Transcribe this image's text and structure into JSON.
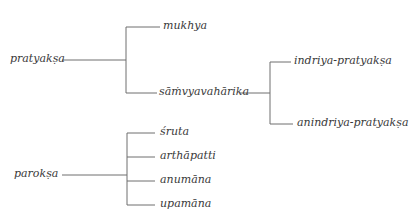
{
  "diagram": {
    "type": "tree",
    "nodes": {
      "pratyaksa": "pratyakṣa",
      "mukhya": "mukhya",
      "samvyavaharika": "sāṁvyavahārika",
      "indriya_pratyaksa": "indriya-pratyakṣa",
      "anindriya_pratyaksa": "anindriya-pratyakṣa",
      "paroksa": "parokṣa",
      "sruta": "śruta",
      "arthapatti": "arthāpatti",
      "anumana": "anumāna",
      "upamana": "upamāna"
    },
    "edges": [
      [
        "pratyakṣa",
        "mukhya"
      ],
      [
        "pratyakṣa",
        "sāṁvyavahārika"
      ],
      [
        "sāṁvyavahārika",
        "indriya-pratyakṣa"
      ],
      [
        "sāṁvyavahārika",
        "anindriya-pratyakṣa"
      ],
      [
        "parokṣa",
        "śruta"
      ],
      [
        "parokṣa",
        "arthāpatti"
      ],
      [
        "parokṣa",
        "anumāna"
      ],
      [
        "parokṣa",
        "upamāna"
      ]
    ],
    "line_color": "#6e6e6e",
    "text_color": "#3a3a3a"
  }
}
